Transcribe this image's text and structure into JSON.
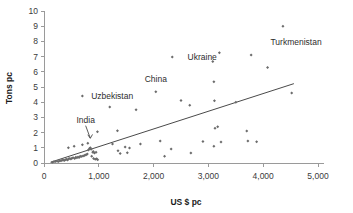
{
  "chart_data": {
    "type": "scatter",
    "title": "",
    "xlabel": "US $ pc",
    "ylabel": "Tons pc",
    "xlim": [
      0,
      5000
    ],
    "ylim": [
      0,
      10
    ],
    "xticks": [
      0,
      1000,
      2000,
      3000,
      4000,
      5000
    ],
    "xticklabels": [
      "0",
      "1,000",
      "2,000",
      "3,000",
      "4,000",
      "5,000"
    ],
    "yticks": [
      0,
      1,
      2,
      3,
      4,
      5,
      6,
      7,
      8,
      9,
      10
    ],
    "yticklabels": [
      "0",
      "1",
      "2",
      "3",
      "4",
      "5",
      "6",
      "7",
      "8",
      "9",
      "10"
    ],
    "grid": false,
    "legend": false,
    "marker_color": "#6b6b6b",
    "trendline_color": "#4a4a4a",
    "axis_color": "#9a9a9a",
    "series": [
      {
        "name": "countries",
        "points": [
          [
            150,
            0.05
          ],
          [
            180,
            0.08
          ],
          [
            210,
            0.1
          ],
          [
            240,
            0.12
          ],
          [
            265,
            0.1
          ],
          [
            290,
            0.15
          ],
          [
            310,
            0.14
          ],
          [
            330,
            0.18
          ],
          [
            350,
            0.2
          ],
          [
            370,
            0.16
          ],
          [
            390,
            0.22
          ],
          [
            410,
            0.25
          ],
          [
            430,
            0.2
          ],
          [
            450,
            0.28
          ],
          [
            470,
            0.3
          ],
          [
            445,
            1.0
          ],
          [
            490,
            0.26
          ],
          [
            510,
            0.32
          ],
          [
            530,
            0.35
          ],
          [
            550,
            1.1
          ],
          [
            560,
            0.3
          ],
          [
            580,
            0.38
          ],
          [
            600,
            0.34
          ],
          [
            620,
            0.4
          ],
          [
            640,
            0.36
          ],
          [
            660,
            0.44
          ],
          [
            680,
            0.42
          ],
          [
            700,
            1.2
          ],
          [
            710,
            0.46
          ],
          [
            730,
            0.48
          ],
          [
            750,
            0.52
          ],
          [
            770,
            0.55
          ],
          [
            790,
            0.6
          ],
          [
            800,
            1.3
          ],
          [
            810,
            0.85
          ],
          [
            830,
            0.95
          ],
          [
            845,
            1.0
          ],
          [
            860,
            0.9
          ],
          [
            870,
            0.45
          ],
          [
            890,
            0.7
          ],
          [
            900,
            0.75
          ],
          [
            905,
            0.3
          ],
          [
            920,
            0.65
          ],
          [
            935,
            0.25
          ],
          [
            950,
            0.7
          ],
          [
            960,
            0.28
          ],
          [
            975,
            2.05
          ],
          [
            980,
            0.22
          ],
          [
            700,
            4.4
          ],
          [
            1200,
            3.68
          ],
          [
            1250,
            1.25
          ],
          [
            1340,
            2.12
          ],
          [
            1350,
            0.8
          ],
          [
            1390,
            0.62
          ],
          [
            1480,
            1.05
          ],
          [
            1520,
            0.68
          ],
          [
            1560,
            0.98
          ],
          [
            1680,
            3.5
          ],
          [
            1760,
            1.25
          ],
          [
            2040,
            4.68
          ],
          [
            2120,
            1.45
          ],
          [
            2200,
            0.45
          ],
          [
            2320,
            0.92
          ],
          [
            2340,
            6.98
          ],
          [
            2500,
            4.12
          ],
          [
            2660,
            3.8
          ],
          [
            2680,
            0.65
          ],
          [
            2900,
            1.42
          ],
          [
            3080,
            6.68
          ],
          [
            3100,
            5.34
          ],
          [
            3100,
            1.1
          ],
          [
            3110,
            4.1
          ],
          [
            3120,
            2.28
          ],
          [
            3170,
            2.38
          ],
          [
            3200,
            7.25
          ],
          [
            3230,
            1.38
          ],
          [
            3500,
            4.0
          ],
          [
            3700,
            2.1
          ],
          [
            3720,
            1.45
          ],
          [
            3780,
            7.1
          ],
          [
            3880,
            1.4
          ],
          [
            4080,
            6.28
          ],
          [
            4360,
            9.0
          ],
          [
            4520,
            4.6
          ]
        ]
      }
    ],
    "trendline": {
      "x0": 120,
      "y0": 0.05,
      "x1": 4560,
      "y1": 5.22
    },
    "annotations": [
      {
        "text": "Turkmenistan",
        "x": 4360,
        "y": 9.0,
        "label_x": 4600,
        "label_y": 7.95,
        "anchor": "middle",
        "leader": false
      },
      {
        "text": "Ukraine",
        "x": 2340,
        "y": 6.98,
        "label_x": 2620,
        "label_y": 6.98,
        "anchor": "start",
        "leader": false
      },
      {
        "text": "China",
        "x": 2040,
        "y": 4.68,
        "label_x": 2040,
        "label_y": 5.55,
        "anchor": "middle",
        "leader": false
      },
      {
        "text": "Uzbekistan",
        "x": 700,
        "y": 4.4,
        "label_x": 860,
        "label_y": 4.4,
        "anchor": "start",
        "leader": false
      },
      {
        "text": "India",
        "x": 845,
        "y": 1.3,
        "label_x": 760,
        "label_y": 2.85,
        "anchor": "middle",
        "leader": true
      }
    ]
  }
}
